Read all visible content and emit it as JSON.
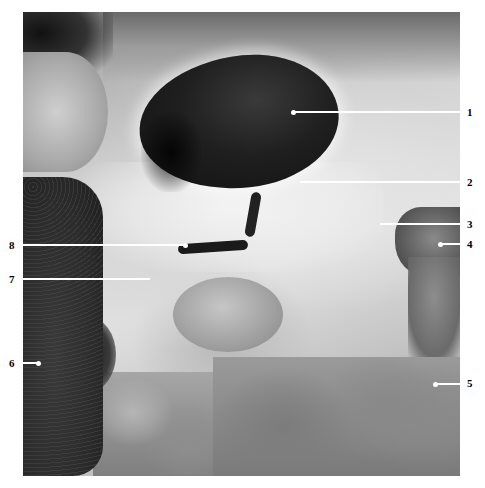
{
  "figure": {
    "type": "grayscale anatomical dissection photograph",
    "labels": [
      {
        "id": "1",
        "text": "1",
        "side": "right",
        "label_x": 467,
        "label_y": 106,
        "line_start_x": 293,
        "line_end_x": 460,
        "line_y": 111,
        "dot": true
      },
      {
        "id": "2",
        "text": "2",
        "side": "right",
        "label_x": 467,
        "label_y": 176,
        "line_start_x": 300,
        "line_end_x": 460,
        "line_y": 181,
        "dot": false
      },
      {
        "id": "3",
        "text": "3",
        "side": "right",
        "label_x": 467,
        "label_y": 218,
        "line_start_x": 380,
        "line_end_x": 460,
        "line_y": 223,
        "dot": false
      },
      {
        "id": "4",
        "text": "4",
        "side": "right",
        "label_x": 467,
        "label_y": 238,
        "line_start_x": 440,
        "line_end_x": 460,
        "line_y": 243,
        "dot": true
      },
      {
        "id": "5",
        "text": "5",
        "side": "right",
        "label_x": 467,
        "label_y": 377,
        "line_start_x": 435,
        "line_end_x": 460,
        "line_y": 383,
        "dot": true
      },
      {
        "id": "6",
        "text": "6",
        "side": "left",
        "label_x": 9,
        "label_y": 357,
        "line_start_x": 23,
        "line_end_x": 38,
        "line_y": 362,
        "dot": true
      },
      {
        "id": "7",
        "text": "7",
        "side": "left",
        "label_x": 9,
        "label_y": 273,
        "line_start_x": 23,
        "line_end_x": 150,
        "line_y": 278,
        "dot": false
      },
      {
        "id": "8",
        "text": "8",
        "side": "left",
        "label_x": 9,
        "label_y": 239,
        "line_start_x": 23,
        "line_end_x": 185,
        "line_y": 244,
        "dot": true
      }
    ]
  }
}
